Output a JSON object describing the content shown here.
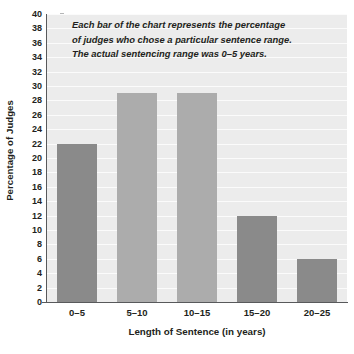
{
  "chart_data": {
    "type": "bar",
    "title": "",
    "xlabel": "Length of Sentence (in years)",
    "ylabel": "Percentage of Judges",
    "categories": [
      "0–5",
      "5–10",
      "10–15",
      "15–20",
      "20–25"
    ],
    "values": [
      22,
      29,
      29,
      12,
      6
    ],
    "ylim": [
      0,
      40
    ],
    "ytick_step": 2,
    "yticks": [
      0,
      2,
      4,
      6,
      8,
      10,
      12,
      14,
      16,
      18,
      20,
      22,
      24,
      26,
      28,
      30,
      32,
      34,
      36,
      38,
      40
    ],
    "ytick_labels": [
      "0",
      "2",
      "4",
      "6",
      "8",
      "10",
      "12",
      "14",
      "16",
      "18",
      "20",
      "22",
      "24",
      "26",
      "28",
      "30",
      "32",
      "34",
      "36",
      "38",
      "40"
    ],
    "bar_colors": [
      "#8a8a8a",
      "#acacac",
      "#acacac",
      "#8a8a8a",
      "#8a8a8a"
    ],
    "grid": true,
    "grid_orientation": "horizontal",
    "legend": "none",
    "plot_background": "#ececec",
    "gridline_color": "#fbfbfb",
    "axis_color": "#58595b",
    "text_color": "#231f20",
    "annotations": [
      {
        "name": "chart-note",
        "lines": [
          "Each bar of the chart represents the percentage",
          "of judges who chose a particular sentence range.",
          "The actual sentencing range was 0–5 years."
        ]
      }
    ]
  }
}
